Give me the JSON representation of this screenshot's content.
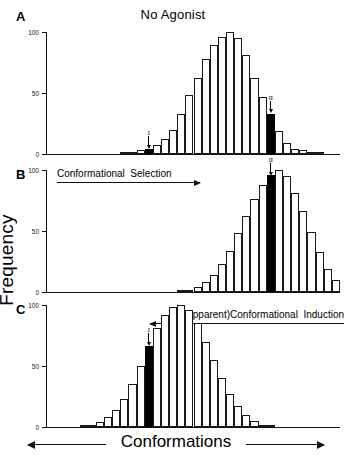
{
  "figure": {
    "y_axis_label": "Frequency",
    "x_axis_label": "Conformations"
  },
  "panels": [
    {
      "letter": "A",
      "title": "No Agonist",
      "markers": [
        {
          "label": "I",
          "bin": 12
        },
        {
          "label": "II",
          "bin": 27
        }
      ]
    },
    {
      "letter": "B",
      "title": "",
      "annotation": {
        "text": "Conformational  Selection",
        "direction": "right"
      },
      "markers": [
        {
          "label": "II",
          "bin": 27
        }
      ]
    },
    {
      "letter": "C",
      "title": "",
      "annotation": {
        "text": "(Apparent)Conformational  Induction",
        "direction": "left"
      },
      "markers": [
        {
          "label": "I",
          "bin": 12
        }
      ]
    }
  ],
  "chart_data": {
    "type": "bar",
    "title": "No Agonist",
    "xlabel": "Conformations",
    "ylabel": "Frequency",
    "ylim": [
      0,
      100
    ],
    "yticks": [
      0,
      50,
      100
    ],
    "grid": false,
    "legend": null,
    "n_bins": 36,
    "bin_indices": [
      0,
      1,
      2,
      3,
      4,
      5,
      6,
      7,
      8,
      9,
      10,
      11,
      12,
      13,
      14,
      15,
      16,
      17,
      18,
      19,
      20,
      21,
      22,
      23,
      24,
      25,
      26,
      27,
      28,
      29,
      30,
      31,
      32,
      33,
      34,
      35
    ],
    "series": [
      {
        "name": "A: No Agonist",
        "panel": "A",
        "highlight_bins": [
          12,
          27
        ],
        "highlight_labels": {
          "12": "I",
          "27": "II"
        },
        "values": [
          0,
          0,
          0,
          0,
          0,
          0,
          0,
          0,
          0,
          1,
          2,
          3,
          4,
          7,
          12,
          20,
          33,
          48,
          62,
          78,
          89,
          96,
          100,
          95,
          81,
          62,
          47,
          33,
          19,
          9,
          4,
          3,
          2,
          1,
          0,
          0
        ]
      },
      {
        "name": "B: Conformational Selection",
        "panel": "B",
        "highlight_bins": [
          27
        ],
        "highlight_labels": {
          "27": "II"
        },
        "values": [
          0,
          0,
          0,
          0,
          0,
          0,
          0,
          0,
          0,
          0,
          0,
          0,
          0,
          0,
          0,
          0,
          1,
          2,
          4,
          8,
          14,
          23,
          34,
          48,
          62,
          76,
          88,
          96,
          100,
          95,
          81,
          66,
          49,
          33,
          19,
          10,
          4,
          2
        ]
      },
      {
        "name": "C: (Apparent) Conformational Induction",
        "panel": "C",
        "highlight_bins": [
          12
        ],
        "highlight_labels": {
          "12": "I"
        },
        "values": [
          0,
          0,
          0,
          0,
          1,
          2,
          4,
          8,
          14,
          23,
          35,
          50,
          66,
          81,
          92,
          98,
          100,
          96,
          85,
          70,
          55,
          40,
          27,
          17,
          10,
          5,
          2,
          1,
          0,
          0,
          0,
          0,
          0,
          0,
          0,
          0
        ]
      }
    ]
  }
}
